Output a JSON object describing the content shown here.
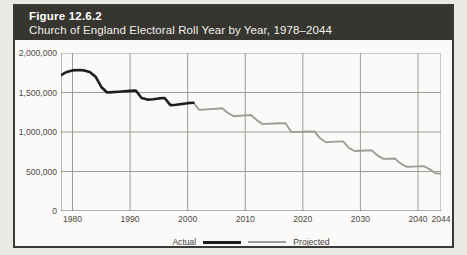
{
  "figure": {
    "number": "Figure 12.6.2",
    "caption": "Church of England Electoral Roll Year by Year, 1978–2044"
  },
  "colors": {
    "band_background": "#37352f",
    "panel_background": "#fbfaf8",
    "page_background": "#e9e9e6",
    "actual_line": "#1d1d1b",
    "projected_line": "#9c9c98",
    "gridline": "#9a9a96",
    "axis": "#6b6a67"
  },
  "chart_data": {
    "type": "line",
    "title": "Church of England Electoral Roll Year by Year, 1978–2044",
    "xlabel": "",
    "ylabel": "",
    "xlim": [
      1978,
      2044
    ],
    "ylim": [
      0,
      2000000
    ],
    "grid": true,
    "legend_position": "bottom-center",
    "y_ticks": [
      0,
      500000,
      1000000,
      1500000,
      2000000
    ],
    "y_tick_labels": [
      "0",
      "500,000",
      "1,000,000",
      "1,500,000",
      "2,000,000"
    ],
    "x_ticks": [
      1980,
      1990,
      2000,
      2010,
      2020,
      2030,
      2040,
      2044
    ],
    "x_tick_labels": [
      "1980",
      "1990",
      "2000",
      "2010",
      "2020",
      "2030",
      "2040",
      "2044"
    ],
    "series": [
      {
        "name": "Actual",
        "color": "#1d1d1b",
        "x": [
          1978,
          1979,
          1980,
          1981,
          1982,
          1983,
          1984,
          1985,
          1986,
          1987,
          1988,
          1989,
          1990,
          1991,
          1992,
          1993,
          1994,
          1995,
          1996,
          1997,
          1998,
          1999,
          2000,
          2001
        ],
        "values": [
          1720000,
          1760000,
          1780000,
          1785000,
          1780000,
          1760000,
          1700000,
          1570000,
          1500000,
          1505000,
          1510000,
          1515000,
          1520000,
          1525000,
          1430000,
          1410000,
          1415000,
          1425000,
          1430000,
          1340000,
          1345000,
          1355000,
          1365000,
          1370000
        ]
      },
      {
        "name": "Projected",
        "color": "#9c9c98",
        "x": [
          2001,
          2002,
          2003,
          2004,
          2005,
          2006,
          2007,
          2008,
          2009,
          2010,
          2011,
          2012,
          2013,
          2014,
          2015,
          2016,
          2017,
          2018,
          2019,
          2020,
          2021,
          2022,
          2023,
          2024,
          2025,
          2026,
          2027,
          2028,
          2029,
          2030,
          2031,
          2032,
          2033,
          2034,
          2035,
          2036,
          2037,
          2038,
          2039,
          2040,
          2041,
          2042,
          2043,
          2044
        ],
        "values": [
          1370000,
          1280000,
          1285000,
          1290000,
          1295000,
          1300000,
          1240000,
          1200000,
          1205000,
          1210000,
          1215000,
          1150000,
          1100000,
          1105000,
          1108000,
          1110000,
          1112000,
          1000000,
          1002000,
          1004000,
          1006000,
          1008000,
          920000,
          870000,
          875000,
          878000,
          880000,
          800000,
          760000,
          762000,
          765000,
          768000,
          700000,
          660000,
          662000,
          664000,
          600000,
          560000,
          562000,
          565000,
          568000,
          530000,
          480000,
          470000
        ]
      }
    ]
  },
  "legend": {
    "actual_label": "Actual",
    "projected_label": "Projected"
  }
}
